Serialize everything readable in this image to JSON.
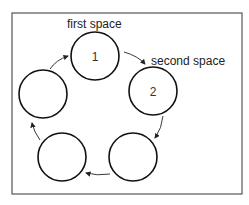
{
  "diagram": {
    "type": "cycle",
    "labels": {
      "first": "first space",
      "second": "second space"
    },
    "spaces": [
      {
        "id": 1,
        "number": "1",
        "cx": 95,
        "cy": 56
      },
      {
        "id": 2,
        "number": "2",
        "cx": 153,
        "cy": 91
      },
      {
        "id": 3,
        "number": "",
        "cx": 133,
        "cy": 157
      },
      {
        "id": 4,
        "number": "",
        "cx": 62,
        "cy": 157
      },
      {
        "id": 5,
        "number": "",
        "cx": 43,
        "cy": 94
      }
    ],
    "direction": "clockwise"
  }
}
